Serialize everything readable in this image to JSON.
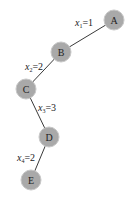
{
  "diagram": {
    "type": "tree-path",
    "nodes": [
      {
        "id": "A",
        "label": "A",
        "x": 114,
        "y": 20
      },
      {
        "id": "B",
        "label": "B",
        "x": 61,
        "y": 52
      },
      {
        "id": "C",
        "label": "C",
        "x": 26,
        "y": 89
      },
      {
        "id": "D",
        "label": "D",
        "x": 49,
        "y": 137
      },
      {
        "id": "E",
        "label": "E",
        "x": 31,
        "y": 180
      }
    ],
    "edges": [
      {
        "from": "A",
        "to": "B",
        "var": "x",
        "sub": "1",
        "value": "=1"
      },
      {
        "from": "B",
        "to": "C",
        "var": "x",
        "sub": "2",
        "value": "=2"
      },
      {
        "from": "C",
        "to": "D",
        "var": "x",
        "sub": "3",
        "value": "=3"
      },
      {
        "from": "D",
        "to": "E",
        "var": "x",
        "sub": "4",
        "value": "=2"
      }
    ],
    "colors": {
      "node_fill": "#a9a9a9",
      "edge": "#3a3a3a",
      "background": "#ffffff"
    }
  }
}
